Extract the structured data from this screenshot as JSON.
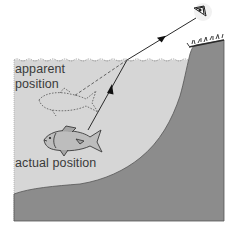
{
  "diagram": {
    "labels": {
      "apparent_line1": "apparent",
      "apparent_line2": "position",
      "actual": "actual position"
    },
    "colors": {
      "background": "#ffffff",
      "water": "#d6d6d6",
      "ground": "#8c8c8c",
      "ground_edge": "#555555",
      "ray": "#2a2a2a",
      "fish_fill": "#bdbdbd",
      "fish_outline": "#3a3a3a",
      "text": "#3a3a3a"
    },
    "elements": {
      "eye": "observer-eye",
      "ray_actual": "light ray from actual fish to surface (arrow up)",
      "ray_refracted": "refracted ray from surface to eye (arrow)",
      "ray_apparent": "dashed extension toward apparent position",
      "fish_actual": "solid fish",
      "fish_apparent": "dashed outline fish",
      "grass": "grass tufts on bank"
    }
  }
}
